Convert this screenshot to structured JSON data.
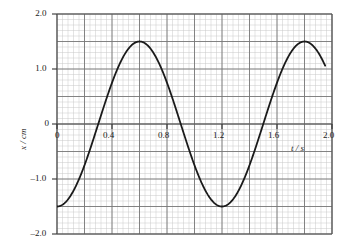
{
  "chart_data": {
    "type": "line",
    "title": "",
    "subtitle": "",
    "xlabel": "t / s",
    "ylabel": "x / cm",
    "xlim": [
      0,
      2.0
    ],
    "ylim": [
      -2.0,
      2.0
    ],
    "x_ticks": [
      0,
      0.4,
      0.8,
      1.2,
      1.6,
      2.0
    ],
    "x_tick_labels": [
      "0",
      "0.4",
      "0.8",
      "1.2",
      "1.6",
      "2.0"
    ],
    "y_ticks": [
      -2.0,
      -1.0,
      0,
      1.0,
      2.0
    ],
    "y_tick_labels": [
      "-2.0",
      "-1.0",
      "0",
      "1.0",
      "2.0"
    ],
    "grid": true,
    "grid_major_x_step": 0.2,
    "grid_major_y_step": 0.5,
    "grid_minor_x_step": 0.04,
    "grid_minor_y_step": 0.1,
    "legend": null,
    "legend_position": "none",
    "annotations": [],
    "series": [
      {
        "name": "displacement",
        "color": "#1a1a1a",
        "amplitude": 1.5,
        "period": 1.2,
        "phase_description": "starts at minimum",
        "x": [
          0.0,
          0.05,
          0.1,
          0.15,
          0.2,
          0.25,
          0.3,
          0.35,
          0.4,
          0.45,
          0.5,
          0.55,
          0.6,
          0.65,
          0.7,
          0.75,
          0.8,
          0.85,
          0.9,
          0.95,
          1.0,
          1.05,
          1.1,
          1.15,
          1.2,
          1.25,
          1.3,
          1.35,
          1.4,
          1.45,
          1.5,
          1.55,
          1.6,
          1.65,
          1.7,
          1.75,
          1.8,
          1.85,
          1.9,
          1.95
        ],
        "values": [
          -1.5,
          -1.45,
          -1.3,
          -1.06,
          -0.75,
          -0.39,
          0.0,
          0.39,
          0.75,
          1.06,
          1.3,
          1.45,
          1.5,
          1.45,
          1.3,
          1.06,
          0.75,
          0.39,
          0.0,
          -0.39,
          -0.75,
          -1.06,
          -1.3,
          -1.45,
          -1.5,
          -1.45,
          -1.3,
          -1.06,
          -0.75,
          -0.39,
          0.0,
          0.39,
          0.75,
          1.06,
          1.3,
          1.45,
          1.5,
          1.45,
          1.3,
          1.06
        ]
      }
    ],
    "key_points": {
      "start": {
        "t": 0.0,
        "x": -1.5
      },
      "first_maximum": {
        "t": 0.6,
        "x": 1.5
      },
      "minimum": {
        "t": 1.2,
        "x": -1.5
      },
      "second_maximum": {
        "t": 1.8,
        "x": 1.5
      },
      "end": {
        "t": 1.95,
        "x": 1.06
      }
    },
    "colors": {
      "curve": "#1a1a1a",
      "axis": "#555555",
      "grid_major": "#777777",
      "grid_minor": "#c9c9c9",
      "background": "#ffffff"
    }
  }
}
